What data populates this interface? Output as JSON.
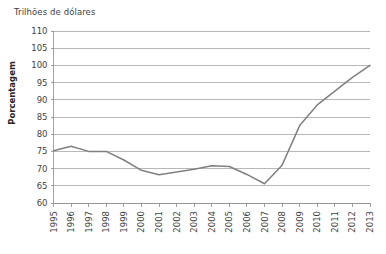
{
  "chart_data": {
    "type": "line",
    "title": "Trilhões de dólares",
    "xlabel": "",
    "ylabel": "Porcentagem",
    "ylim": [
      60,
      110
    ],
    "ytick_step": 5,
    "yticks": [
      110,
      105,
      100,
      95,
      90,
      85,
      80,
      75,
      70,
      65,
      60
    ],
    "grid": true,
    "legend": false,
    "legend_position": "none",
    "line_color": "#808080",
    "categories": [
      "1995",
      "1996",
      "1997",
      "1998",
      "1999",
      "2000",
      "2001",
      "2002",
      "2003",
      "2004",
      "2005",
      "2006",
      "2007",
      "2008",
      "2009",
      "2010",
      "2011",
      "2012",
      "2013"
    ],
    "values": [
      75.2,
      76.5,
      75.0,
      75.0,
      72.5,
      69.5,
      68.2,
      69.0,
      69.8,
      70.8,
      70.6,
      68.3,
      65.6,
      71.0,
      82.5,
      88.5,
      92.5,
      96.5,
      100.0
    ]
  }
}
